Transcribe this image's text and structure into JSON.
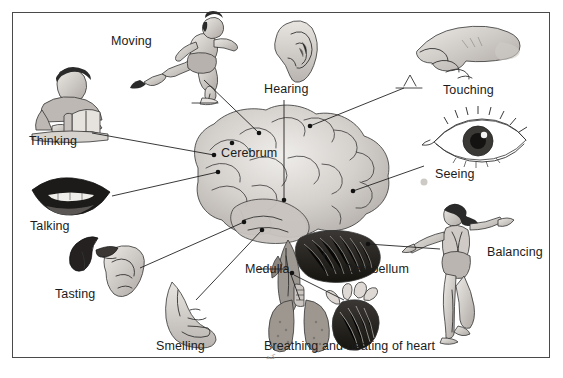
{
  "figure": {
    "border_color": "#4a4a4a",
    "background": "#ffffff"
  },
  "brain_labels": [
    {
      "id": "cerebrum",
      "text": "Cerebrum"
    },
    {
      "id": "medulla",
      "text": "Medulla"
    },
    {
      "id": "cerebellum",
      "text": "Cerebellum"
    }
  ],
  "function_labels": [
    {
      "id": "moving",
      "text": "Moving",
      "icon": "runner-icon"
    },
    {
      "id": "hearing",
      "text": "Hearing",
      "icon": "ear-icon"
    },
    {
      "id": "touching",
      "text": "Touching",
      "icon": "hand-touch-icon"
    },
    {
      "id": "thinking",
      "text": "Thinking",
      "icon": "person-reading-icon"
    },
    {
      "id": "seeing",
      "text": "Seeing",
      "icon": "eye-icon"
    },
    {
      "id": "talking",
      "text": "Talking",
      "icon": "lips-icon"
    },
    {
      "id": "tasting",
      "text": "Tasting",
      "icon": "tongue-hand-icon"
    },
    {
      "id": "balancing",
      "text": "Balancing",
      "icon": "balancing-figure-icon"
    },
    {
      "id": "smelling",
      "text": "Smelling",
      "icon": "nose-icon"
    },
    {
      "id": "breathing",
      "text": "Breathing and beating of heart",
      "icon": "lungs-heart-icon"
    }
  ],
  "marks": {
    "faint_handwriting": "كند"
  }
}
